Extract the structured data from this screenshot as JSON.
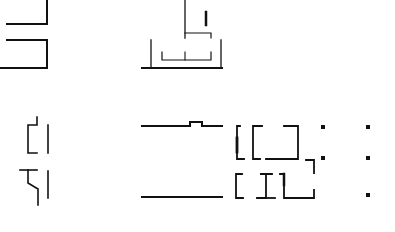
{
  "diagram": {
    "type": "floor-plan-fragments",
    "background": "#ffffff",
    "stroke_color": "#111111",
    "groups": [
      {
        "name": "top-left-walls"
      },
      {
        "name": "top-center-walls"
      },
      {
        "name": "bottom-left-walls"
      },
      {
        "name": "bottom-center-walls"
      },
      {
        "name": "bottom-right-rooms"
      },
      {
        "name": "column-markers"
      }
    ]
  }
}
